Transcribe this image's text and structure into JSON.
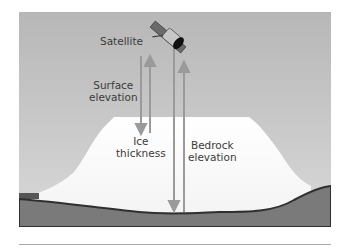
{
  "diagram": {
    "labels": {
      "satellite": "Satellite",
      "surface_elevation_line1": "Surface",
      "surface_elevation_line2": "elevation",
      "ice_thickness_line1": "Ice",
      "ice_thickness_line2": "thickness",
      "bedrock_elevation_line1": "Bedrock",
      "bedrock_elevation_line2": "elevation"
    },
    "colors": {
      "sky_top": "#b9b9b9",
      "sky_bottom": "#d6d6d6",
      "ice": "#ffffff",
      "bedrock": "#7a7a7a",
      "bedrock_edge": "#333333",
      "arrow": "#9a9a9a",
      "text": "#3b3b3b",
      "separator": "#a9a9a9"
    },
    "icons": {
      "satellite": "satellite-icon"
    }
  }
}
